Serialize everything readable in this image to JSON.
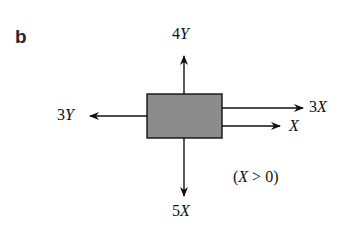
{
  "panel_label": "b",
  "diagram": {
    "type": "free-body diagram",
    "body": {
      "shape": "rectangle",
      "fill": "#8c8c8c"
    },
    "forces": [
      {
        "direction": "up",
        "label": "4Y"
      },
      {
        "direction": "left",
        "label": "3Y"
      },
      {
        "direction": "right",
        "label": "3X",
        "position": "upper"
      },
      {
        "direction": "right",
        "label": "X",
        "position": "lower"
      },
      {
        "direction": "down",
        "label": "5X"
      }
    ],
    "condition": "(X > 0)"
  },
  "labels": {
    "up_coef": "4",
    "up_var": "Y",
    "left_coef": "3",
    "left_var": "Y",
    "right_upper_coef": "3",
    "right_upper_var": "X",
    "right_lower_var": "X",
    "down_coef": "5",
    "down_var": "X",
    "condition_open": "(",
    "condition_var": "X",
    "condition_rest": " > 0)"
  }
}
